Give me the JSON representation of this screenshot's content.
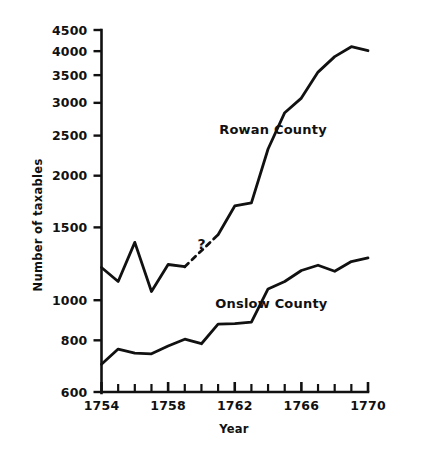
{
  "chart_data": {
    "type": "line",
    "title": "",
    "xlabel": "Year",
    "ylabel": "Number of taxables",
    "xlim": [
      1754,
      1770
    ],
    "ylim": [
      600,
      4500
    ],
    "yscale": "log",
    "grid": false,
    "legend_position": "inline-annotation",
    "xticklabels": [
      "1754",
      "1758",
      "1762",
      "1766",
      "1770"
    ],
    "xtickvalues": [
      1754,
      1758,
      1762,
      1766,
      1770
    ],
    "xminortickvalues": [
      1755,
      1756,
      1757,
      1759,
      1760,
      1761,
      1763,
      1764,
      1765,
      1767,
      1768,
      1769
    ],
    "yticklabels": [
      "600",
      "800",
      "1000",
      "1500",
      "2000",
      "2500",
      "3000",
      "3500",
      "4000",
      "4500"
    ],
    "ytickvalues": [
      600,
      800,
      1000,
      1500,
      2000,
      2500,
      3000,
      3500,
      4000,
      4500
    ],
    "annotations": [
      {
        "text": "?",
        "x": 1760,
        "y": 1330
      }
    ],
    "series": [
      {
        "name": "Rowan County",
        "label_x": 1764.3,
        "label_y": 2520,
        "x": [
          1754,
          1755,
          1756,
          1757,
          1758,
          1759,
          1762,
          1763,
          1764,
          1765,
          1766,
          1767,
          1768,
          1769,
          1770
        ],
        "values": [
          1200,
          1110,
          1380,
          1050,
          1220,
          1205,
          1690,
          1720,
          2320,
          2840,
          3080,
          3560,
          3880,
          4100,
          4010
        ],
        "solid_segments": [
          {
            "x": [
              1754,
              1755,
              1756,
              1757,
              1758,
              1759
            ],
            "values": [
              1200,
              1110,
              1380,
              1050,
              1220,
              1205
            ]
          },
          {
            "x": [
              1761,
              1762,
              1763,
              1764,
              1765,
              1766,
              1767,
              1768,
              1769,
              1770
            ],
            "values": [
              1440,
              1690,
              1720,
              2320,
              2840,
              3080,
              3560,
              3880,
              4100,
              4010
            ]
          }
        ],
        "dashed_segment": {
          "x": [
            1759,
            1761
          ],
          "values": [
            1205,
            1440
          ]
        }
      },
      {
        "name": "Onslow County",
        "label_x": 1764.2,
        "label_y": 955,
        "x": [
          1754,
          1755,
          1756,
          1757,
          1758,
          1759,
          1760,
          1761,
          1762,
          1763,
          1764,
          1765,
          1766,
          1767,
          1768,
          1769,
          1770
        ],
        "values": [
          700,
          762,
          745,
          742,
          775,
          805,
          785,
          875,
          878,
          885,
          1065,
          1110,
          1180,
          1215,
          1175,
          1240,
          1265
        ]
      }
    ]
  },
  "labels": {
    "ylabel": "Number of taxables",
    "xlabel": "Year",
    "rowan": "Rowan County",
    "onslow": "Onslow County",
    "question_mark": "?"
  }
}
